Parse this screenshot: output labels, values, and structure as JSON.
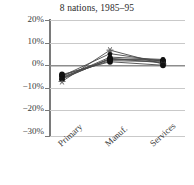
{
  "chart_data": {
    "type": "line",
    "title": "8 nations, 1985–95",
    "xlabel": "",
    "ylabel": "",
    "categories": [
      "Primary",
      "Manuf.",
      "Services"
    ],
    "ylim": [
      -30,
      20
    ],
    "yticks": [
      20,
      10,
      0,
      -10,
      -20,
      -30
    ],
    "ytick_labels": [
      "20%",
      "10%",
      "0%",
      "−10%",
      "−20%",
      "−30%"
    ],
    "grid": true,
    "legend": "none",
    "series": [
      {
        "name": "nation-1",
        "values": [
          -4.0,
          3.0,
          2.5
        ]
      },
      {
        "name": "nation-2",
        "values": [
          -4.5,
          2.5,
          2.0
        ]
      },
      {
        "name": "nation-3",
        "values": [
          -5.0,
          4.0,
          3.0
        ]
      },
      {
        "name": "nation-4",
        "values": [
          -5.5,
          3.5,
          1.5
        ]
      },
      {
        "name": "nation-5",
        "values": [
          -4.2,
          5.5,
          2.2
        ]
      },
      {
        "name": "nation-6",
        "values": [
          -6.5,
          7.0,
          1.0
        ]
      },
      {
        "name": "nation-7",
        "values": [
          -3.5,
          2.0,
          0.5
        ]
      },
      {
        "name": "nation-8",
        "values": [
          -5.2,
          3.2,
          2.8
        ]
      }
    ]
  },
  "axis": {
    "y_tick_labels": [
      "20%",
      "10%",
      "0%",
      "−10%",
      "−20%",
      "−30%"
    ],
    "x_tick_labels": [
      "Primary",
      "Manuf.",
      "Services"
    ]
  }
}
